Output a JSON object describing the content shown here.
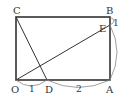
{
  "diagram": {
    "type": "geometry",
    "shape": "rectangle OABC",
    "points": {
      "O": {
        "label": "O",
        "x": 16,
        "y": 80
      },
      "A": {
        "label": "A",
        "x": 110,
        "y": 80
      },
      "B": {
        "label": "B",
        "x": 110,
        "y": 17
      },
      "C": {
        "label": "C",
        "x": 16,
        "y": 17
      },
      "D": {
        "label": "D",
        "x": 47,
        "y": 80
      },
      "E": {
        "label": "E",
        "x": 110,
        "y": 25
      }
    },
    "segments": [
      "OA",
      "AB",
      "BC",
      "CO",
      "CD",
      "OE"
    ],
    "lengths": {
      "OD": "1",
      "DA": "2",
      "EB": "1",
      "AE": "3"
    },
    "colors": {
      "stroke": "#333333",
      "arc": "#888888",
      "background": "#ffffff"
    }
  }
}
